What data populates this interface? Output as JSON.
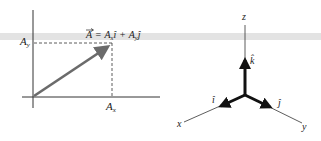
{
  "left_diagram": {
    "equation": {
      "vector": "A",
      "equals": "=",
      "term1_coef": "A",
      "term1_sub": "x",
      "term1_unit": "î",
      "plus": "+",
      "term2_coef": "A",
      "term2_sub": "y",
      "term2_unit": "ĵ"
    },
    "y_tick_label": {
      "main": "A",
      "sub": "y"
    },
    "x_tick_label": {
      "main": "A",
      "sub": "x"
    }
  },
  "right_diagram": {
    "axis_labels": {
      "x": "x",
      "y": "y",
      "z": "z"
    },
    "unit_vectors": {
      "i": "î",
      "j": "ĵ",
      "k": "k̂"
    }
  },
  "colors": {
    "vector_arrow": "#6b6b6b",
    "axes": "#333333",
    "unit_vector": "#111111",
    "band": "#dcdcdc"
  }
}
